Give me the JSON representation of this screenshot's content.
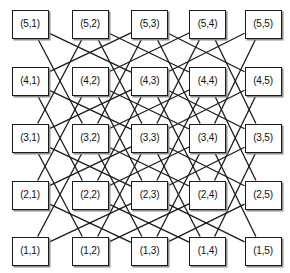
{
  "figure": {
    "width": 290,
    "height": 273,
    "background_color": "#ffffff"
  },
  "style": {
    "node_fill": "#ffffff",
    "node_border_color": "#1b1b1b",
    "node_border_width": 1.4,
    "node_shadow_color": "#8d8d8d",
    "node_text_color": "#111111",
    "node_font_size": 10,
    "edge_color": "#1b1b1b",
    "edge_width": 1.3
  },
  "grid": {
    "rows": 5,
    "cols": 5,
    "col_centers": [
      30,
      90,
      149.5,
      207.5,
      263
    ],
    "row_centers": [
      24,
      81,
      138,
      195,
      251
    ],
    "node_width": 37,
    "node_height": 29
  },
  "nodes": [
    {
      "id": "5-1",
      "label": "(5,1)",
      "row": 5,
      "col": 1,
      "x": 11.5,
      "y": 9.5,
      "w": 37,
      "h": 29
    },
    {
      "id": "5-2",
      "label": "(5,2)",
      "row": 5,
      "col": 2,
      "x": 71.5,
      "y": 9.5,
      "w": 37,
      "h": 29
    },
    {
      "id": "5-3",
      "label": "(5,3)",
      "row": 5,
      "col": 3,
      "x": 131,
      "y": 9.5,
      "w": 37,
      "h": 29
    },
    {
      "id": "5-4",
      "label": "(5,4)",
      "row": 5,
      "col": 4,
      "x": 189,
      "y": 9.5,
      "w": 37,
      "h": 29
    },
    {
      "id": "5-5",
      "label": "(5,5)",
      "row": 5,
      "col": 5,
      "x": 244.5,
      "y": 9.5,
      "w": 37,
      "h": 29
    },
    {
      "id": "4-1",
      "label": "(4,1)",
      "row": 4,
      "col": 1,
      "x": 11.5,
      "y": 66.5,
      "w": 37,
      "h": 29
    },
    {
      "id": "4-2",
      "label": "(4,2)",
      "row": 4,
      "col": 2,
      "x": 71.5,
      "y": 66.5,
      "w": 37,
      "h": 29
    },
    {
      "id": "4-3",
      "label": "(4,3)",
      "row": 4,
      "col": 3,
      "x": 131,
      "y": 66.5,
      "w": 37,
      "h": 29
    },
    {
      "id": "4-4",
      "label": "(4,4)",
      "row": 4,
      "col": 4,
      "x": 189,
      "y": 66.5,
      "w": 37,
      "h": 29
    },
    {
      "id": "4-5",
      "label": "(4,5)",
      "row": 4,
      "col": 5,
      "x": 244.5,
      "y": 66.5,
      "w": 37,
      "h": 29
    },
    {
      "id": "3-1",
      "label": "(3,1)",
      "row": 3,
      "col": 1,
      "x": 11.5,
      "y": 123.5,
      "w": 37,
      "h": 29
    },
    {
      "id": "3-2",
      "label": "(3,2)",
      "row": 3,
      "col": 2,
      "x": 71.5,
      "y": 123.5,
      "w": 37,
      "h": 29
    },
    {
      "id": "3-3",
      "label": "(3,3)",
      "row": 3,
      "col": 3,
      "x": 131,
      "y": 123.5,
      "w": 37,
      "h": 29
    },
    {
      "id": "3-4",
      "label": "(3,4)",
      "row": 3,
      "col": 4,
      "x": 189,
      "y": 123.5,
      "w": 37,
      "h": 29
    },
    {
      "id": "3-5",
      "label": "(3,5)",
      "row": 3,
      "col": 5,
      "x": 244.5,
      "y": 123.5,
      "w": 37,
      "h": 29
    },
    {
      "id": "2-1",
      "label": "(2,1)",
      "row": 2,
      "col": 1,
      "x": 11.5,
      "y": 180.5,
      "w": 37,
      "h": 29
    },
    {
      "id": "2-2",
      "label": "(2,2)",
      "row": 2,
      "col": 2,
      "x": 71.5,
      "y": 180.5,
      "w": 37,
      "h": 29
    },
    {
      "id": "2-3",
      "label": "(2,3)",
      "row": 2,
      "col": 3,
      "x": 131,
      "y": 180.5,
      "w": 37,
      "h": 29
    },
    {
      "id": "2-4",
      "label": "(2,4)",
      "row": 2,
      "col": 4,
      "x": 189,
      "y": 180.5,
      "w": 37,
      "h": 29
    },
    {
      "id": "2-5",
      "label": "(2,5)",
      "row": 2,
      "col": 5,
      "x": 244.5,
      "y": 180.5,
      "w": 37,
      "h": 29
    },
    {
      "id": "1-1",
      "label": "(1,1)",
      "row": 1,
      "col": 1,
      "x": 11.5,
      "y": 236.5,
      "w": 37,
      "h": 29
    },
    {
      "id": "1-2",
      "label": "(1,2)",
      "row": 1,
      "col": 2,
      "x": 71.5,
      "y": 236.5,
      "w": 37,
      "h": 29
    },
    {
      "id": "1-3",
      "label": "(1,3)",
      "row": 1,
      "col": 3,
      "x": 131,
      "y": 236.5,
      "w": 37,
      "h": 29
    },
    {
      "id": "1-4",
      "label": "(1,4)",
      "row": 1,
      "col": 4,
      "x": 189,
      "y": 236.5,
      "w": 37,
      "h": 29
    },
    {
      "id": "1-5",
      "label": "(1,5)",
      "row": 1,
      "col": 5,
      "x": 244.5,
      "y": 236.5,
      "w": 37,
      "h": 29
    }
  ],
  "edges": [
    [
      "1-1",
      "2-3"
    ],
    [
      "1-1",
      "3-2"
    ],
    [
      "1-2",
      "2-4"
    ],
    [
      "1-2",
      "3-1"
    ],
    [
      "1-2",
      "3-3"
    ],
    [
      "1-3",
      "2-1"
    ],
    [
      "1-3",
      "2-5"
    ],
    [
      "1-3",
      "3-2"
    ],
    [
      "1-3",
      "3-4"
    ],
    [
      "1-4",
      "2-2"
    ],
    [
      "1-4",
      "3-3"
    ],
    [
      "1-4",
      "3-5"
    ],
    [
      "1-5",
      "2-3"
    ],
    [
      "1-5",
      "3-4"
    ],
    [
      "2-1",
      "3-3"
    ],
    [
      "2-1",
      "4-2"
    ],
    [
      "2-2",
      "3-4"
    ],
    [
      "2-2",
      "4-1"
    ],
    [
      "2-2",
      "4-3"
    ],
    [
      "2-3",
      "3-1"
    ],
    [
      "2-3",
      "3-5"
    ],
    [
      "2-3",
      "4-2"
    ],
    [
      "2-3",
      "4-4"
    ],
    [
      "2-4",
      "3-2"
    ],
    [
      "2-4",
      "4-3"
    ],
    [
      "2-4",
      "4-5"
    ],
    [
      "2-5",
      "3-3"
    ],
    [
      "2-5",
      "4-4"
    ],
    [
      "3-1",
      "4-3"
    ],
    [
      "3-1",
      "5-2"
    ],
    [
      "3-2",
      "4-4"
    ],
    [
      "3-2",
      "5-1"
    ],
    [
      "3-2",
      "5-3"
    ],
    [
      "3-3",
      "4-1"
    ],
    [
      "3-3",
      "4-5"
    ],
    [
      "3-3",
      "5-2"
    ],
    [
      "3-3",
      "5-4"
    ],
    [
      "3-4",
      "4-2"
    ],
    [
      "3-4",
      "5-3"
    ],
    [
      "3-4",
      "5-5"
    ],
    [
      "3-5",
      "4-3"
    ],
    [
      "3-5",
      "5-4"
    ],
    [
      "4-1",
      "5-3"
    ],
    [
      "4-2",
      "5-4"
    ],
    [
      "4-3",
      "5-1"
    ],
    [
      "4-3",
      "5-5"
    ],
    [
      "4-4",
      "5-2"
    ],
    [
      "4-5",
      "5-3"
    ]
  ]
}
